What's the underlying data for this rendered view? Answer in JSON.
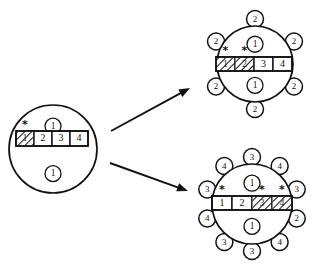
{
  "figure": {
    "title": "",
    "background_color": "#ffffff",
    "ink_color": "#111111",
    "width": 318,
    "height": 268
  },
  "nodes": [
    {
      "id": "source",
      "name": "left-source-node",
      "cx": 53,
      "cy": 149,
      "r": 44,
      "top_token": "1",
      "bottom_token": "1",
      "bar": {
        "x": 16,
        "y": 131,
        "cell_width": 18,
        "cell_height": 15,
        "cells": [
          {
            "label": "1",
            "hatched": true,
            "star": true
          },
          {
            "label": "2",
            "hatched": false,
            "star": false
          },
          {
            "label": "3",
            "hatched": false,
            "star": false
          },
          {
            "label": "4",
            "hatched": false,
            "star": false
          }
        ]
      },
      "pendants": []
    },
    {
      "id": "upper-result",
      "name": "upper-right-result-node",
      "cx": 255,
      "cy": 64,
      "r": 38,
      "top_token": "1",
      "bottom_token": "1",
      "bar": {
        "x": 216,
        "y": 57,
        "cell_width": 19,
        "cell_height": 14,
        "cells": [
          {
            "label": "1",
            "hatched": true,
            "star": true
          },
          {
            "label": "2",
            "hatched": true,
            "star": true
          },
          {
            "label": "3",
            "hatched": false,
            "star": false
          },
          {
            "label": "4",
            "hatched": false,
            "star": false
          }
        ]
      },
      "pendants": [
        {
          "label": "2",
          "angle": -90
        },
        {
          "label": "2",
          "angle": -150
        },
        {
          "label": "2",
          "angle": -30
        },
        {
          "label": "2",
          "angle": 30
        },
        {
          "label": "2",
          "angle": 90
        },
        {
          "label": "2",
          "angle": 150
        }
      ]
    },
    {
      "id": "lower-result",
      "name": "lower-right-result-node",
      "cx": 252,
      "cy": 204,
      "r": 40,
      "top_token": "1",
      "bottom_token": "1",
      "bar": {
        "x": 212,
        "y": 196,
        "cell_width": 20,
        "cell_height": 14,
        "cells": [
          {
            "label": "1",
            "hatched": false,
            "star": true
          },
          {
            "label": "2",
            "hatched": false,
            "star": false
          },
          {
            "label": "3",
            "hatched": true,
            "star": true
          },
          {
            "label": "4",
            "hatched": true,
            "star": true
          }
        ]
      },
      "pendants": [
        {
          "label": "3",
          "angle": -90
        },
        {
          "label": "4",
          "angle": -126
        },
        {
          "label": "4",
          "angle": -54
        },
        {
          "label": "3",
          "angle": -162
        },
        {
          "label": "3",
          "angle": -18
        },
        {
          "label": "4",
          "angle": 162
        },
        {
          "label": "2",
          "angle": 18
        },
        {
          "label": "3",
          "angle": 126
        },
        {
          "label": "4",
          "angle": 54
        },
        {
          "label": "3",
          "angle": 90
        }
      ]
    }
  ],
  "arrows": [
    {
      "name": "arrow-to-upper-result",
      "x1": 111,
      "y1": 131,
      "x2": 190,
      "y2": 88
    },
    {
      "name": "arrow-to-lower-result",
      "x1": 110,
      "y1": 163,
      "x2": 188,
      "y2": 191
    }
  ],
  "glyphs": {
    "star": "*",
    "pendant_radius": 8.5,
    "token_radius": 8
  }
}
